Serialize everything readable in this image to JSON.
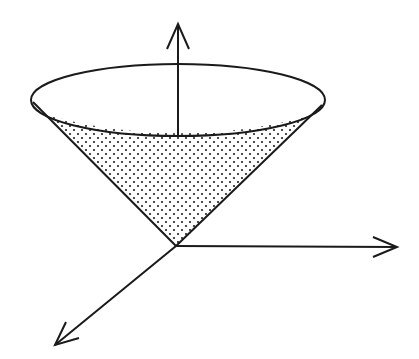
{
  "diagram": {
    "title": "",
    "colors": {
      "stroke": "#1a1a1a",
      "background": "#ffffff",
      "dot": "#222222"
    },
    "origin": [
      176,
      246
    ],
    "axes": [
      {
        "name": "z-axis",
        "from": [
          178,
          133
        ],
        "to": [
          178,
          25
        ],
        "direction": "up"
      },
      {
        "name": "x-axis",
        "from": [
          176,
          246
        ],
        "to": [
          397,
          247
        ],
        "direction": "right"
      },
      {
        "name": "y-axis",
        "from": [
          176,
          246
        ],
        "to": [
          55,
          345
        ],
        "direction": "down-left"
      }
    ],
    "cone": {
      "rim_ellipse": {
        "cx": 178,
        "cy": 100,
        "rx": 147,
        "ry": 36
      },
      "left_generator": {
        "from": [
          33,
          102
        ],
        "to": [
          176,
          246
        ]
      },
      "right_generator": {
        "from": [
          322,
          105
        ],
        "to": [
          176,
          246
        ]
      },
      "fill": "dotted"
    }
  }
}
